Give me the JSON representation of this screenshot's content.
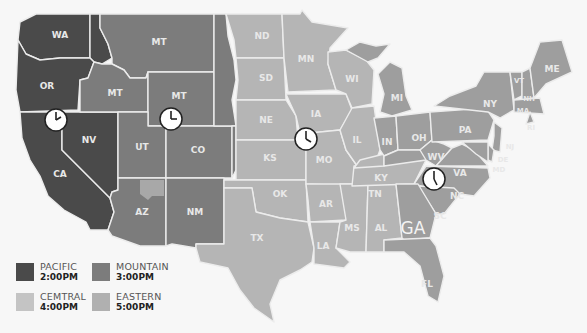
{
  "colors": {
    "pacific": "#4a4a4a",
    "mountain": "#7c7c7c",
    "central": "#b5b5b5",
    "eastern": "#9e9e9e",
    "background": "#f7f7f7",
    "border": "#ececec"
  },
  "states": {
    "WA": "WA",
    "OR": "OR",
    "CA": "CA",
    "NV": "NV",
    "MT1": "MT",
    "MT2": "MT",
    "MT3": "MT",
    "UT": "UT",
    "CO": "CO",
    "AZ": "AZ",
    "NM": "NM",
    "ND": "ND",
    "SD": "SD",
    "NE": "NE",
    "KS": "KS",
    "OK": "OK",
    "TX": "TX",
    "MN": "MN",
    "IA": "IA",
    "MO": "MO",
    "AR": "AR",
    "LA": "LA",
    "WI": "WI",
    "IL": "IL",
    "MS": "MS",
    "AL": "AL",
    "TN": "TN",
    "KY": "KY",
    "MI": "MI",
    "IN": "IN",
    "OH": "OH",
    "GA": "GA",
    "FL": "FL",
    "SC": "SC",
    "NC": "NC",
    "VA": "VA",
    "WV": "WV",
    "PA": "PA",
    "NY": "NY",
    "VT": "VT",
    "NH": "NH",
    "ME": "ME",
    "MA": "MA",
    "RI": "RI",
    "NJ": "NJ",
    "DE": "DE",
    "MD": "MD"
  },
  "clocks": [
    {
      "zone": "Pacific",
      "time": "2:00"
    },
    {
      "zone": "Mountain",
      "time": "3:00"
    },
    {
      "zone": "Central",
      "time": "4:00"
    },
    {
      "zone": "Eastern",
      "time": "5:00"
    }
  ],
  "legend": [
    {
      "name": "PACIFIC",
      "time": "2:00PM"
    },
    {
      "name": "MOUNTAIN",
      "time": "3:00PM"
    },
    {
      "name": "CEMTRAL",
      "time": "4:00PM"
    },
    {
      "name": "EASTERN",
      "time": "5:00PM"
    }
  ]
}
